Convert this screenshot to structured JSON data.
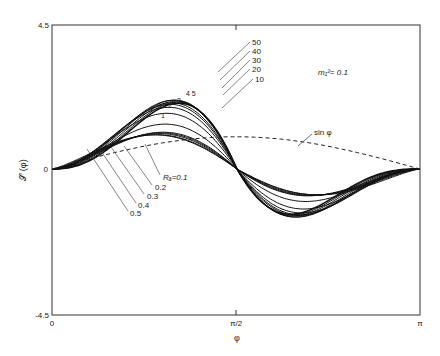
{
  "chart_data": {
    "type": "line",
    "title": "",
    "xlabel": "φ",
    "ylabel": "𝒮 (φ)",
    "xlim": [
      0,
      3.14159
    ],
    "ylim": [
      -4.5,
      4.5
    ],
    "x_ticks": [
      "0",
      "π/2",
      "π"
    ],
    "y_ticks": [
      "4.5",
      "0",
      "-4.5"
    ],
    "grid": false,
    "annotation_param": "m₁² = 0.1",
    "reference_curve": {
      "name": "sin φ",
      "style": "dashed"
    },
    "series_labels": [
      "Rₐ=0.1",
      "0.2",
      "0.3",
      "0.4",
      "0.5",
      "1",
      "2",
      "3",
      "4",
      "5",
      "10",
      "20",
      "30",
      "40",
      "50"
    ],
    "series": [
      {
        "name": "Ra=0.1",
        "amp": 0.95,
        "xmax": 1.3
      },
      {
        "name": "0.2",
        "amp": 1.0,
        "xmax": 1.28
      },
      {
        "name": "0.3",
        "amp": 1.08,
        "xmax": 1.27
      },
      {
        "name": "0.4",
        "amp": 1.15,
        "xmax": 1.26
      },
      {
        "name": "0.5",
        "amp": 1.22,
        "xmax": 1.25
      },
      {
        "name": "1",
        "amp": 1.55,
        "xmax": 1.22
      },
      {
        "name": "2",
        "amp": 2.0,
        "xmax": 1.2
      },
      {
        "name": "3",
        "amp": 2.3,
        "xmax": 1.2
      },
      {
        "name": "4",
        "amp": 2.5,
        "xmax": 1.2
      },
      {
        "name": "5",
        "amp": 2.65,
        "xmax": 1.2
      },
      {
        "name": "10",
        "amp": 2.85,
        "xmax": 1.2
      },
      {
        "name": "20",
        "amp": 2.95,
        "xmax": 1.2
      },
      {
        "name": "30",
        "amp": 3.0,
        "xmax": 1.2
      },
      {
        "name": "40",
        "amp": 3.05,
        "xmax": 1.2
      },
      {
        "name": "50",
        "amp": 3.1,
        "xmax": 1.2
      }
    ]
  },
  "labels": {
    "y_top": "4.5",
    "y_zero": "0",
    "y_bottom": "-4.5",
    "x_zero": "0",
    "x_mid": "π/2",
    "x_end": "π",
    "xlabel": "φ",
    "ylabel": "𝒮 (φ)",
    "param": "m₁²= 0.1",
    "sin": "sin φ",
    "ra": "Rₐ=0.1",
    "r02": "0.2",
    "r03": "0.3",
    "r04": "0.4",
    "r05": "0.5",
    "r1": "1",
    "r2": "2",
    "r3": "3",
    "r45": "4  5",
    "r10": "10",
    "r20": "20",
    "r30": "30",
    "r40": "40",
    "r50": "50"
  }
}
